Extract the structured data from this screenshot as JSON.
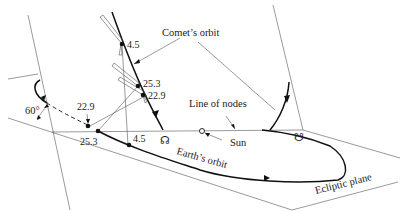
{
  "figure": {
    "labels": {
      "comets_orbit": "Comet’s orbit",
      "line_of_nodes": "Line of nodes",
      "sun": "Sun",
      "earths_orbit": "Earth’s orbit",
      "ecliptic_plane": "Ecliptic plane",
      "inclination_angle": "60°",
      "ascending_node_symbol": "☊",
      "descending_node_symbol": "☋"
    },
    "comet_positions": [
      {
        "label": "4.5"
      },
      {
        "label": "25.3"
      },
      {
        "label": "22.9"
      }
    ],
    "earth_positions": [
      {
        "label": "22.9"
      },
      {
        "label": "25.3"
      },
      {
        "label": "4.5"
      }
    ],
    "colors": {
      "line": "#222222",
      "background": "#ffffff"
    }
  }
}
